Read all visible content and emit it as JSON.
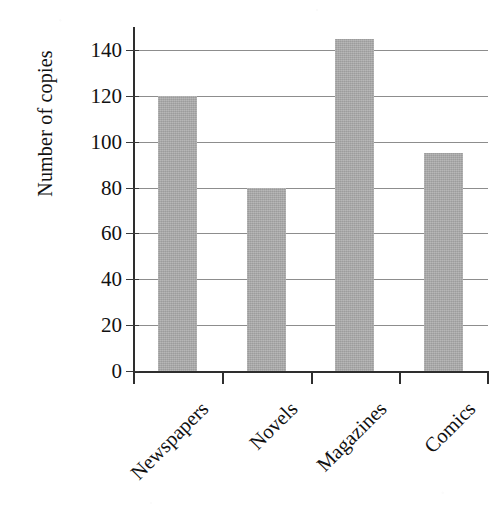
{
  "chart_data": {
    "type": "bar",
    "title": "",
    "subtitle": "",
    "xlabel": "",
    "ylabel": "Number of copies",
    "categories": [
      "Newspapers",
      "Novels",
      "Magazines",
      "Comics"
    ],
    "values": [
      120,
      80,
      145,
      95
    ],
    "ylim": [
      0,
      150
    ],
    "ytick_labels": [
      "0",
      "20",
      "40",
      "60",
      "80",
      "100",
      "120",
      "140"
    ],
    "ytick_values": [
      0,
      20,
      40,
      60,
      80,
      100,
      120,
      140
    ],
    "grid": true,
    "grid_axis": "y",
    "legend": false,
    "legend_position": "none",
    "bar_color": "#a9a9a9",
    "axis_color": "#2e2e2e",
    "gridline_color": "#8d8d8d",
    "background_color": "#ffffff",
    "xtick_label_rotation": -45,
    "ylabel_rotation": -90,
    "annotations": []
  }
}
